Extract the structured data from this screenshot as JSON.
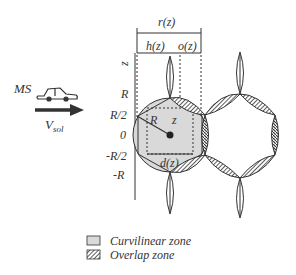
{
  "vehicle": {
    "label": "MS",
    "velocity_label": "V",
    "velocity_subscript": "sol"
  },
  "axis": {
    "name": "z",
    "ticks": [
      "R",
      "R/2",
      "0",
      "-R/2",
      "-R"
    ]
  },
  "dimensions": {
    "r": "r(z)",
    "h": "h(z)",
    "o": "o(z)",
    "d": "d(z)",
    "radius": "R",
    "z": "z"
  },
  "legend": [
    {
      "label": "Curvilinear zone",
      "swatch": "gray-fill"
    },
    {
      "label": "Overlap zone",
      "swatch": "hatched"
    }
  ],
  "colors": {
    "curvilinear_fill": "#d9d9d9",
    "stroke": "#333333"
  }
}
